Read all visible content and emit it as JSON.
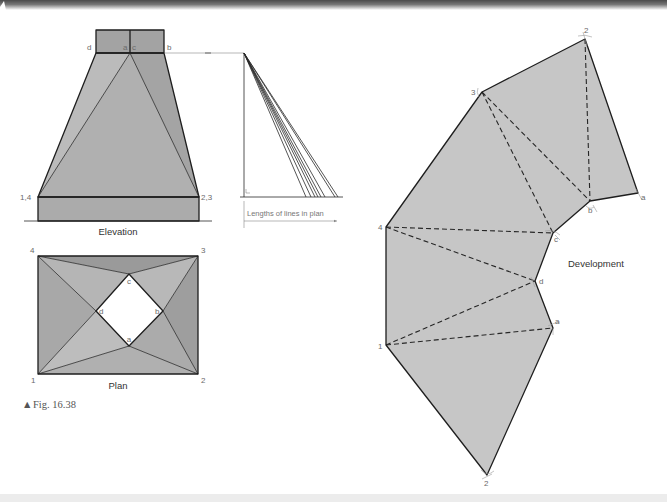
{
  "figure": {
    "caption_marker": "▲",
    "caption": "Fig. 16.38"
  },
  "elevation": {
    "title": "Elevation",
    "labels": {
      "d": "d",
      "a": "a",
      "c": "c",
      "b": "b",
      "left_base": "1,4",
      "right_base": "2,3"
    }
  },
  "true_length": {
    "label": "Lengths of lines in plan"
  },
  "plan": {
    "title": "Plan",
    "labels": {
      "p4": "4",
      "p3": "3",
      "p1": "1",
      "p2": "2",
      "c": "c",
      "d": "d",
      "b": "b",
      "a": "a"
    }
  },
  "development": {
    "title": "Development",
    "labels": {
      "top2": "2",
      "p3": "3",
      "p4": "4",
      "p1": "1",
      "bottom2": "2",
      "a_lower": "a",
      "d": "d",
      "c": "c",
      "b": "b",
      "a_upper": "a"
    }
  },
  "colors": {
    "header": "#555555",
    "development_fill": "#c6c6c6",
    "footer_band": "#ececec"
  }
}
